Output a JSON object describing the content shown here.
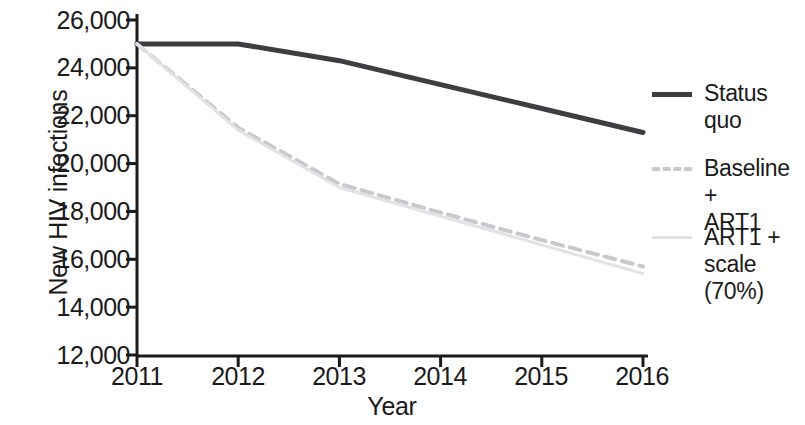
{
  "chart_data": {
    "type": "line",
    "title": "",
    "xlabel": "Year",
    "ylabel": "New HIV infections",
    "x": [
      2011,
      2012,
      2013,
      2014,
      2015,
      2016
    ],
    "xtick_labels": [
      "2011",
      "2012",
      "2013",
      "2014",
      "2015",
      "2016"
    ],
    "ytick_labels": [
      "12,000",
      "14,000",
      "16,000",
      "18,000",
      "20,000",
      "22,000",
      "24,000",
      "26,000"
    ],
    "yticks": [
      12000,
      14000,
      16000,
      18000,
      20000,
      22000,
      24000,
      26000
    ],
    "ylim": [
      12000,
      26000
    ],
    "xlim": [
      2011,
      2016
    ],
    "grid": false,
    "legend_position": "right",
    "series": [
      {
        "name": "Status quo",
        "values": [
          25000,
          25000,
          24300,
          23300,
          22300,
          21300
        ],
        "color": "#3e3e42",
        "style": "solid",
        "width": 5
      },
      {
        "name": "Baseline + ART1",
        "values": [
          25000,
          21500,
          19150,
          17950,
          16800,
          15700
        ],
        "color": "#c9c9cd",
        "style": "dashed",
        "width": 4
      },
      {
        "name": "ART1 + scale (70%)",
        "values": [
          25000,
          21400,
          19000,
          17800,
          16600,
          15400
        ],
        "color": "#e2e2e6",
        "style": "solid",
        "width": 3
      }
    ]
  },
  "legend": {
    "items": [
      {
        "label_line1": "Status",
        "label_line2": "quo",
        "swatch": "solid-dark-line-icon"
      },
      {
        "label_line1": "Baseline +",
        "label_line2": "ART1",
        "swatch": "dashed-gray-line-icon"
      },
      {
        "label_line1": "ART1 +",
        "label_line2": "scale (70%)",
        "swatch": "solid-light-line-icon"
      }
    ]
  }
}
